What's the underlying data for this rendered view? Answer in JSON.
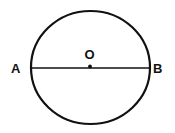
{
  "diagram": {
    "type": "circle-with-diameter",
    "labels": {
      "left_endpoint": "A",
      "right_endpoint": "B",
      "center": "O"
    },
    "colors": {
      "stroke": "#111111",
      "background": "#ffffff"
    }
  }
}
